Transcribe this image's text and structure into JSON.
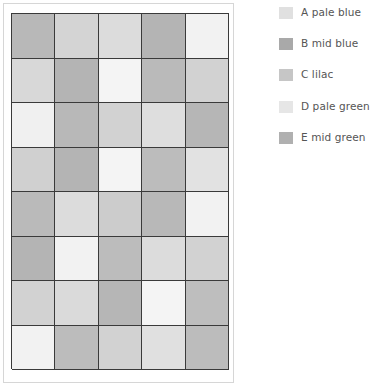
{
  "legend": {
    "items": [
      {
        "key": "A",
        "label": "A pale blue",
        "color": "#e0e0e0",
        "top": 7
      },
      {
        "key": "B",
        "label": "B mid blue",
        "color": "#a9a9a9",
        "top": 38
      },
      {
        "key": "C",
        "label": "C lilac",
        "color": "#c6c6c6",
        "top": 69
      },
      {
        "key": "D",
        "label": "D pale green",
        "color": "#e6e6e6",
        "top": 101
      },
      {
        "key": "E",
        "label": "E mid green",
        "color": "#b0b0b0",
        "top": 132
      }
    ]
  },
  "grid": {
    "columns": 5,
    "rows": 8,
    "cells": [
      [
        "#b8b8b8",
        "#d4d4d4",
        "#dcdcdc",
        "#b4b4b4",
        "#f2f2f2"
      ],
      [
        "#d8d8d8",
        "#b4b4b4",
        "#f4f4f4",
        "#bababa",
        "#d2d2d2"
      ],
      [
        "#f0f0f0",
        "#b8b8b8",
        "#d2d2d2",
        "#dedede",
        "#b6b6b6"
      ],
      [
        "#d0d0d0",
        "#b4b4b4",
        "#f4f4f4",
        "#bcbcbc",
        "#e2e2e2"
      ],
      [
        "#bababa",
        "#dcdcdc",
        "#cccccc",
        "#b8b8b8",
        "#f2f2f2"
      ],
      [
        "#b4b4b4",
        "#f2f2f2",
        "#bcbcbc",
        "#dcdcdc",
        "#d2d2d2"
      ],
      [
        "#d2d2d2",
        "#dadada",
        "#b6b6b6",
        "#f4f4f4",
        "#bebebe"
      ],
      [
        "#f2f2f2",
        "#bcbcbc",
        "#d2d2d2",
        "#e0e0e0",
        "#bcbcbc"
      ]
    ]
  }
}
